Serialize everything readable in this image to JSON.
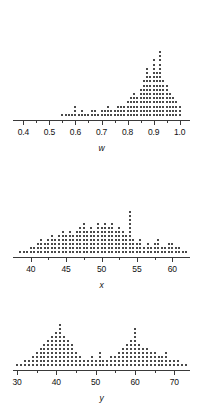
{
  "figure": {
    "type": "dotplot-panel",
    "width": 201,
    "height": 417,
    "background": "#ffffff",
    "dot_color": "#4a4a4a",
    "axis_color": "#3a3a3a"
  },
  "chart_data": [
    {
      "type": "scatter",
      "variant": "stacked-dotplot",
      "title": "",
      "xlabel": "w",
      "ylabel": "",
      "xlim": [
        0.36,
        1.04
      ],
      "grid": false,
      "legend": null,
      "ticks": {
        "major_values": [
          0.4,
          0.5,
          0.6,
          0.7,
          0.8,
          0.9,
          1.0
        ],
        "major_labels": [
          "0.4",
          "0.5",
          "0.6",
          "0.7",
          "0.8",
          "0.9",
          "1.0"
        ],
        "minor_values": [
          0.45,
          0.55,
          0.65,
          0.75,
          0.85,
          0.95
        ]
      },
      "description": "strongly left-skewed distribution concentrated near 1.0",
      "bin_width": 0.0125,
      "bins": [
        {
          "x": 0.55,
          "count": 1
        },
        {
          "x": 0.5625,
          "count": 1
        },
        {
          "x": 0.575,
          "count": 1
        },
        {
          "x": 0.5875,
          "count": 1
        },
        {
          "x": 0.6,
          "count": 3
        },
        {
          "x": 0.6125,
          "count": 1
        },
        {
          "x": 0.625,
          "count": 2
        },
        {
          "x": 0.6375,
          "count": 1
        },
        {
          "x": 0.65,
          "count": 1
        },
        {
          "x": 0.6625,
          "count": 2
        },
        {
          "x": 0.675,
          "count": 2
        },
        {
          "x": 0.6875,
          "count": 1
        },
        {
          "x": 0.7,
          "count": 2
        },
        {
          "x": 0.7125,
          "count": 2
        },
        {
          "x": 0.725,
          "count": 3
        },
        {
          "x": 0.7375,
          "count": 2
        },
        {
          "x": 0.75,
          "count": 2
        },
        {
          "x": 0.7625,
          "count": 3
        },
        {
          "x": 0.775,
          "count": 3
        },
        {
          "x": 0.7875,
          "count": 3
        },
        {
          "x": 0.8,
          "count": 4
        },
        {
          "x": 0.8125,
          "count": 5
        },
        {
          "x": 0.825,
          "count": 6
        },
        {
          "x": 0.8375,
          "count": 5
        },
        {
          "x": 0.85,
          "count": 7
        },
        {
          "x": 0.8625,
          "count": 9
        },
        {
          "x": 0.875,
          "count": 12
        },
        {
          "x": 0.8875,
          "count": 10
        },
        {
          "x": 0.9,
          "count": 14
        },
        {
          "x": 0.9125,
          "count": 11
        },
        {
          "x": 0.925,
          "count": 16
        },
        {
          "x": 0.9375,
          "count": 9
        },
        {
          "x": 0.95,
          "count": 8
        },
        {
          "x": 0.9625,
          "count": 6
        },
        {
          "x": 0.975,
          "count": 5
        },
        {
          "x": 0.9875,
          "count": 4
        },
        {
          "x": 1.0,
          "count": 3
        }
      ]
    },
    {
      "type": "scatter",
      "variant": "stacked-dotplot",
      "title": "",
      "xlabel": "x",
      "ylabel": "",
      "xlim": [
        37.5,
        62.5
      ],
      "grid": false,
      "legend": null,
      "ticks": {
        "major_values": [
          40,
          45,
          50,
          55,
          60
        ],
        "major_labels": [
          "40",
          "45",
          "50",
          "55",
          "60"
        ],
        "minor_values": [
          42.5,
          47.5,
          52.5,
          57.5
        ]
      },
      "description": "approximately symmetric bell-shaped distribution centered near 50",
      "bin_width": 0.5,
      "bins": [
        {
          "x": 38.5,
          "count": 1
        },
        {
          "x": 39.0,
          "count": 1
        },
        {
          "x": 39.5,
          "count": 1
        },
        {
          "x": 40.0,
          "count": 2
        },
        {
          "x": 40.5,
          "count": 2
        },
        {
          "x": 41.0,
          "count": 3
        },
        {
          "x": 41.5,
          "count": 4
        },
        {
          "x": 42.0,
          "count": 3
        },
        {
          "x": 42.5,
          "count": 4
        },
        {
          "x": 43.0,
          "count": 5
        },
        {
          "x": 43.5,
          "count": 4
        },
        {
          "x": 44.0,
          "count": 5
        },
        {
          "x": 44.5,
          "count": 6
        },
        {
          "x": 45.0,
          "count": 5
        },
        {
          "x": 45.5,
          "count": 6
        },
        {
          "x": 46.0,
          "count": 5
        },
        {
          "x": 46.5,
          "count": 6
        },
        {
          "x": 47.0,
          "count": 7
        },
        {
          "x": 47.5,
          "count": 8
        },
        {
          "x": 48.0,
          "count": 6
        },
        {
          "x": 48.5,
          "count": 7
        },
        {
          "x": 49.0,
          "count": 6
        },
        {
          "x": 49.5,
          "count": 8
        },
        {
          "x": 50.0,
          "count": 7
        },
        {
          "x": 50.5,
          "count": 8
        },
        {
          "x": 51.0,
          "count": 7
        },
        {
          "x": 51.5,
          "count": 8
        },
        {
          "x": 52.0,
          "count": 6
        },
        {
          "x": 52.5,
          "count": 7
        },
        {
          "x": 53.0,
          "count": 6
        },
        {
          "x": 53.5,
          "count": 5
        },
        {
          "x": 54.0,
          "count": 11
        },
        {
          "x": 54.5,
          "count": 4
        },
        {
          "x": 55.0,
          "count": 3
        },
        {
          "x": 55.5,
          "count": 4
        },
        {
          "x": 56.0,
          "count": 2
        },
        {
          "x": 56.5,
          "count": 3
        },
        {
          "x": 57.0,
          "count": 2
        },
        {
          "x": 57.5,
          "count": 3
        },
        {
          "x": 58.0,
          "count": 4
        },
        {
          "x": 58.5,
          "count": 2
        },
        {
          "x": 59.0,
          "count": 2
        },
        {
          "x": 59.5,
          "count": 3
        },
        {
          "x": 60.0,
          "count": 3
        },
        {
          "x": 60.5,
          "count": 2
        },
        {
          "x": 61.0,
          "count": 2
        },
        {
          "x": 61.5,
          "count": 1
        },
        {
          "x": 62.0,
          "count": 1
        }
      ]
    },
    {
      "type": "scatter",
      "variant": "stacked-dotplot",
      "title": "",
      "xlabel": "y",
      "ylabel": "",
      "xlim": [
        29,
        74
      ],
      "grid": false,
      "legend": null,
      "ticks": {
        "major_values": [
          30,
          40,
          50,
          60,
          70
        ],
        "major_labels": [
          "30",
          "40",
          "50",
          "60",
          "70"
        ],
        "minor_values": [
          35,
          45,
          55,
          65
        ]
      },
      "description": "bimodal distribution with peaks near 41 and 60",
      "bin_width": 1,
      "bins": [
        {
          "x": 30,
          "count": 1
        },
        {
          "x": 31,
          "count": 1
        },
        {
          "x": 32,
          "count": 2
        },
        {
          "x": 33,
          "count": 2
        },
        {
          "x": 34,
          "count": 3
        },
        {
          "x": 35,
          "count": 4
        },
        {
          "x": 36,
          "count": 5
        },
        {
          "x": 37,
          "count": 6
        },
        {
          "x": 38,
          "count": 7
        },
        {
          "x": 39,
          "count": 8
        },
        {
          "x": 40,
          "count": 9
        },
        {
          "x": 41,
          "count": 11
        },
        {
          "x": 42,
          "count": 8
        },
        {
          "x": 43,
          "count": 7
        },
        {
          "x": 44,
          "count": 6
        },
        {
          "x": 45,
          "count": 4
        },
        {
          "x": 46,
          "count": 3
        },
        {
          "x": 47,
          "count": 2
        },
        {
          "x": 48,
          "count": 2
        },
        {
          "x": 49,
          "count": 3
        },
        {
          "x": 50,
          "count": 2
        },
        {
          "x": 51,
          "count": 4
        },
        {
          "x": 52,
          "count": 2
        },
        {
          "x": 53,
          "count": 2
        },
        {
          "x": 54,
          "count": 3
        },
        {
          "x": 55,
          "count": 3
        },
        {
          "x": 56,
          "count": 4
        },
        {
          "x": 57,
          "count": 5
        },
        {
          "x": 58,
          "count": 6
        },
        {
          "x": 59,
          "count": 7
        },
        {
          "x": 60,
          "count": 10
        },
        {
          "x": 61,
          "count": 6
        },
        {
          "x": 62,
          "count": 5
        },
        {
          "x": 63,
          "count": 5
        },
        {
          "x": 64,
          "count": 4
        },
        {
          "x": 65,
          "count": 4
        },
        {
          "x": 66,
          "count": 3
        },
        {
          "x": 67,
          "count": 3
        },
        {
          "x": 68,
          "count": 4
        },
        {
          "x": 69,
          "count": 2
        },
        {
          "x": 70,
          "count": 2
        },
        {
          "x": 71,
          "count": 2
        },
        {
          "x": 72,
          "count": 1
        },
        {
          "x": 73,
          "count": 1
        }
      ]
    }
  ]
}
